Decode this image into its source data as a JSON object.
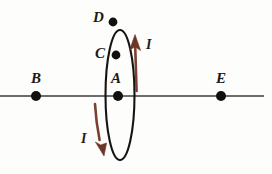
{
  "figure": {
    "background_color": "#fdfdfb"
  },
  "axis": {
    "name": "horizontal-axis-line",
    "color": "#6d6d6d",
    "y": 96,
    "x_start": 0,
    "x_end": 264,
    "thickness": 2
  },
  "loop": {
    "name": "current-loop",
    "shape": "ellipse",
    "color": "#141414",
    "center_x": 120,
    "center_y": 95,
    "radius_x": 14.5,
    "radius_y": 65,
    "thickness": 2.1
  },
  "points": [
    {
      "id": "B",
      "label": "B",
      "x": 36,
      "y": 96,
      "label_x": 31,
      "label_y": 71,
      "dot_radius": 5.0
    },
    {
      "id": "A",
      "label": "A",
      "x": 118,
      "y": 96,
      "label_x": 111,
      "label_y": 71,
      "dot_radius": 5.0
    },
    {
      "id": "C",
      "label": "C",
      "x": 116,
      "y": 55,
      "label_x": 95,
      "label_y": 46,
      "dot_radius": 4.4
    },
    {
      "id": "D",
      "label": "D",
      "x": 113,
      "y": 22,
      "label_x": 93,
      "label_y": 10,
      "dot_radius": 4.4
    },
    {
      "id": "E",
      "label": "E",
      "x": 221,
      "y": 96,
      "label_x": 216,
      "label_y": 71,
      "dot_radius": 5.0
    }
  ],
  "current_arrows": [
    {
      "id": "current-up",
      "label": "I",
      "direction": "up",
      "color": "#7b4030",
      "label_x": 146,
      "label_y": 38,
      "shaft_x": 136,
      "shaft_top": 40,
      "shaft_bottom": 91
    },
    {
      "id": "current-down",
      "label": "I",
      "direction": "down",
      "color": "#7b4030",
      "label_x": 81,
      "label_y": 132,
      "shaft_x": 96,
      "shaft_top": 104,
      "shaft_bottom": 152
    }
  ],
  "legend": {
    "current_symbol": "I",
    "current_color": "#7b4030"
  }
}
